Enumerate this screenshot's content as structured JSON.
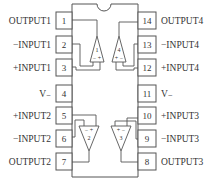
{
  "diagram": {
    "type": "quad op-amp 14-pin DIP pinout",
    "left_pins": [
      {
        "num": "1",
        "label": "OUTPUT1"
      },
      {
        "num": "2",
        "label": "−INPUT1"
      },
      {
        "num": "3",
        "label": "+INPUT1"
      },
      {
        "num": "4",
        "label": "V₋"
      },
      {
        "num": "5",
        "label": "+INPUT2"
      },
      {
        "num": "6",
        "label": "−INPUT2"
      },
      {
        "num": "7",
        "label": "OUTPUT2"
      }
    ],
    "right_pins": [
      {
        "num": "14",
        "label": "OUTPUT4"
      },
      {
        "num": "13",
        "label": "−INPUT4"
      },
      {
        "num": "12",
        "label": "+INPUT4"
      },
      {
        "num": "11",
        "label": "V₋"
      },
      {
        "num": "10",
        "label": "+INPUT3"
      },
      {
        "num": "9",
        "label": "−INPUT3"
      },
      {
        "num": "8",
        "label": "OUTPUT3"
      }
    ],
    "amplifiers": [
      {
        "id": "1",
        "signs": "− +"
      },
      {
        "id": "2",
        "signs": "− +"
      },
      {
        "id": "3",
        "signs": "+ −"
      },
      {
        "id": "4",
        "signs": "+ −"
      }
    ],
    "colors": {
      "line": "#555555",
      "text": "#333333"
    }
  }
}
